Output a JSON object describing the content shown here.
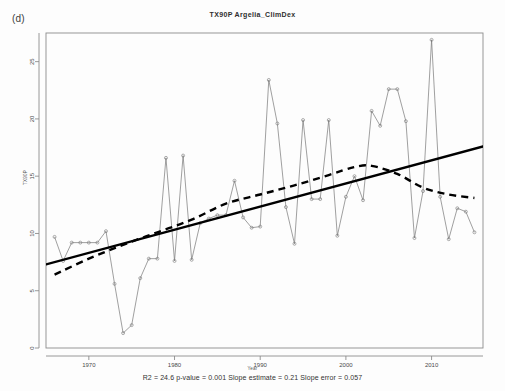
{
  "figure": {
    "panel_label": "(d)",
    "title": "TX90P  Argelia_ClimDex",
    "caption": "R2 = 24.6  p-value = 0.001  Slope estimate = 0.21  Slope error = 0.057",
    "background_color": "#ffffff"
  },
  "chart_data": {
    "type": "line",
    "title": "TX90P  Argelia_ClimDex",
    "xlabel": "Year",
    "ylabel": "TX90P",
    "xlim": [
      1965,
      2016
    ],
    "ylim": [
      0,
      27.5
    ],
    "xticks": [
      1970,
      1980,
      1990,
      2000,
      2010
    ],
    "xticklabels": [
      "1970",
      "1980",
      "1990",
      "2000",
      "2010"
    ],
    "yticks": [
      0,
      5,
      10,
      15,
      20,
      25
    ],
    "yticklabels": [
      "0",
      "5",
      "10",
      "15",
      "20",
      "25"
    ],
    "grid": false,
    "legend": "none",
    "annotations": [
      "R2 = 24.6",
      "p-value = 0.001",
      "Slope estimate = 0.21",
      "Slope error = 0.057"
    ],
    "statistics": {
      "r_squared": 24.6,
      "p_value": 0.001,
      "slope_estimate": 0.21,
      "slope_error": 0.057
    },
    "series": [
      {
        "name": "TX90P annual values",
        "style": "thin-line-with-open-circle-markers",
        "color": "#777777",
        "marker": "open-circle",
        "x": [
          1966,
          1967,
          1968,
          1969,
          1970,
          1971,
          1972,
          1973,
          1974,
          1975,
          1976,
          1977,
          1978,
          1979,
          1980,
          1981,
          1982,
          1983,
          1984,
          1985,
          1986,
          1987,
          1988,
          1989,
          1990,
          1991,
          1992,
          1993,
          1994,
          1995,
          1996,
          1997,
          1998,
          1999,
          2000,
          2001,
          2002,
          2003,
          2004,
          2005,
          2006,
          2007,
          2008,
          2009,
          2010,
          2011,
          2012,
          2013,
          2014,
          2015
        ],
        "y": [
          9.7,
          7.6,
          9.2,
          9.2,
          9.2,
          9.2,
          10.2,
          5.6,
          1.3,
          2.0,
          6.1,
          7.8,
          7.8,
          16.6,
          7.6,
          16.8,
          7.7,
          10.9,
          11.3,
          11.6,
          11.6,
          14.6,
          11.4,
          10.5,
          10.6,
          23.4,
          19.6,
          12.3,
          9.1,
          19.9,
          13.0,
          13.0,
          19.9,
          9.8,
          13.2,
          15.0,
          12.9,
          20.7,
          19.4,
          22.6,
          22.6,
          19.8,
          9.6,
          13.7,
          26.9,
          13.2,
          9.5,
          12.2,
          11.9,
          10.1
        ]
      },
      {
        "name": "Linear trend",
        "style": "thick-solid-line",
        "color": "#000000",
        "x": [
          1965,
          2016
        ],
        "y": [
          7.3,
          17.6
        ]
      },
      {
        "name": "Smoothed trend",
        "style": "thick-dashed-line",
        "color": "#000000",
        "x": [
          1966,
          1970,
          1974,
          1978,
          1982,
          1986,
          1990,
          1994,
          1998,
          2001,
          2003,
          2006,
          2009,
          2012,
          2015
        ],
        "y": [
          6.4,
          7.8,
          9.0,
          10.1,
          11.2,
          12.6,
          13.4,
          14.2,
          15.1,
          15.8,
          15.9,
          15.2,
          14.0,
          13.4,
          13.1
        ]
      }
    ]
  }
}
